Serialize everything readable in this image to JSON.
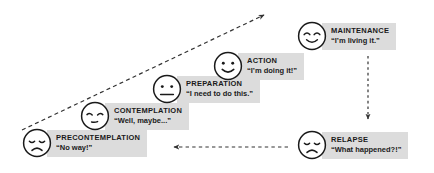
{
  "diagram": {
    "label_box_color": "#dcdcdc",
    "line_color": "#333333",
    "stages": [
      {
        "id": "precontemplation",
        "name": "PRECONTEMPLATION",
        "quote": "“No way!”",
        "face": "sad-face",
        "expression": "sad",
        "x": 22,
        "y": 128
      },
      {
        "id": "contemplation",
        "name": "CONTEMPLATION",
        "quote": "“Well, maybe...”",
        "face": "pensive-face",
        "expression": "pensive",
        "x": 80,
        "y": 101
      },
      {
        "id": "preparation",
        "name": "PREPARATION",
        "quote": "“I need to do this.”",
        "face": "neutral-face",
        "expression": "neutral",
        "x": 152,
        "y": 74
      },
      {
        "id": "action",
        "name": "ACTION",
        "quote": "“I’m doing it!”",
        "face": "smiling-face",
        "expression": "smile",
        "x": 213,
        "y": 51
      },
      {
        "id": "maintenance",
        "name": "MAINTENANCE",
        "quote": "“I’m living it.”",
        "face": "content-face",
        "expression": "content",
        "x": 297,
        "y": 21
      },
      {
        "id": "relapse",
        "name": "RELAPSE",
        "quote": "“What happened?!”",
        "face": "sad-face",
        "expression": "sad",
        "x": 297,
        "y": 130
      }
    ],
    "connectors": [
      {
        "id": "progress-arrow",
        "name": "progress-dashed-arrow",
        "from": "precontemplation",
        "to": "maintenance",
        "style": "dashed",
        "direction": "up-right"
      },
      {
        "id": "relapse-arrow",
        "name": "relapse-dashed-arrow",
        "from": "maintenance",
        "to": "relapse",
        "style": "dashed",
        "direction": "down"
      },
      {
        "id": "restart-arrow",
        "name": "restart-dashed-arrow",
        "from": "relapse",
        "to": "precontemplation",
        "style": "dashed",
        "direction": "left"
      }
    ]
  }
}
